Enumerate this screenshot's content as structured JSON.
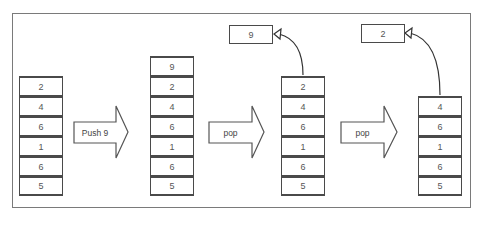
{
  "diagram": {
    "stacks": [
      {
        "id": "initial",
        "items": [
          "2",
          "4",
          "6",
          "1",
          "6",
          "5"
        ]
      },
      {
        "id": "after-push",
        "items": [
          "9",
          "2",
          "4",
          "6",
          "1",
          "6",
          "5"
        ]
      },
      {
        "id": "after-pop-1",
        "items": [
          "2",
          "4",
          "6",
          "1",
          "6",
          "5"
        ]
      },
      {
        "id": "after-pop-2",
        "items": [
          "4",
          "6",
          "1",
          "6",
          "5"
        ]
      }
    ],
    "operations": [
      {
        "label": "Push 9"
      },
      {
        "label": "pop"
      },
      {
        "label": "pop"
      }
    ],
    "popped": [
      {
        "value": "9"
      },
      {
        "value": "2"
      }
    ],
    "colors": {
      "stroke": "#4a4a4a",
      "text": "#555555",
      "frame": "#7a7a7a"
    }
  }
}
